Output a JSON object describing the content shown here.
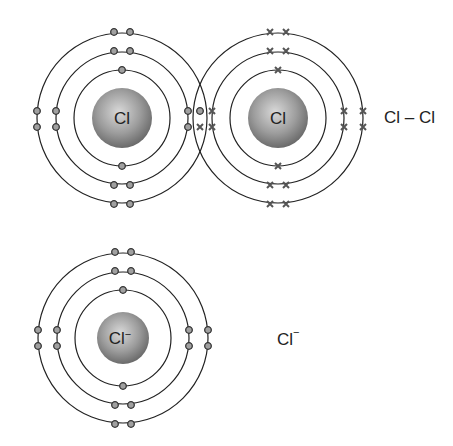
{
  "diagram": {
    "title": "",
    "molecule": {
      "formula_label": "Cl – Cl",
      "atoms": [
        {
          "symbol": "Cl",
          "electron_marker": "dot",
          "shells": [
            2,
            8,
            7
          ]
        },
        {
          "symbol": "Cl",
          "electron_marker": "cross",
          "shells": [
            2,
            8,
            7
          ]
        }
      ],
      "shared_pair": "one dot + one cross shared between atoms"
    },
    "ion": {
      "symbol": "Cl",
      "charge": "−",
      "formula_label": "Cl",
      "formula_charge": "−",
      "electron_marker": "dot",
      "shells": [
        2,
        8,
        8
      ]
    },
    "colors": {
      "line": "#222222",
      "electron_fill": "#9a9a9a",
      "nucleus_light": "#d8d8d8",
      "nucleus_dark": "#6a6a6a"
    }
  }
}
